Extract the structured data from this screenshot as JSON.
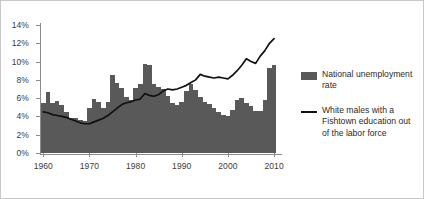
{
  "chart_data": {
    "type": "bar",
    "title": "",
    "subtitle": "",
    "xlabel": "",
    "ylabel": "",
    "xlim": [
      1959.5,
      2011.5
    ],
    "ylim": [
      0,
      14
    ],
    "ytick_labels": [
      "0%",
      "2%",
      "4%",
      "6%",
      "8%",
      "10%",
      "12%",
      "14%"
    ],
    "ytick_values": [
      0,
      2,
      4,
      6,
      8,
      10,
      12,
      14
    ],
    "xtick_labels": [
      "1960",
      "1970",
      "1980",
      "1990",
      "2000",
      "2010"
    ],
    "xtick_values": [
      1960,
      1970,
      1980,
      1990,
      2000,
      2010
    ],
    "grid": false,
    "legend_position": "right",
    "x": [
      1960,
      1961,
      1962,
      1963,
      1964,
      1965,
      1966,
      1967,
      1968,
      1969,
      1970,
      1971,
      1972,
      1973,
      1974,
      1975,
      1976,
      1977,
      1978,
      1979,
      1980,
      1981,
      1982,
      1983,
      1984,
      1985,
      1986,
      1987,
      1988,
      1989,
      1990,
      1991,
      1992,
      1993,
      1994,
      1995,
      1996,
      1997,
      1998,
      1999,
      2000,
      2001,
      2002,
      2003,
      2004,
      2005,
      2006,
      2007,
      2008,
      2009,
      2010
    ],
    "series": [
      {
        "name": "National unemployment rate",
        "type": "bar",
        "color": "#595959",
        "values": [
          5.5,
          6.7,
          5.5,
          5.7,
          5.2,
          4.5,
          3.8,
          3.8,
          3.6,
          3.5,
          4.9,
          5.9,
          5.6,
          4.9,
          5.6,
          8.5,
          7.7,
          7.1,
          6.1,
          5.8,
          7.1,
          7.6,
          9.7,
          9.6,
          7.5,
          7.2,
          7.0,
          6.2,
          5.5,
          5.3,
          5.6,
          6.8,
          7.5,
          6.9,
          6.1,
          5.6,
          5.4,
          4.9,
          4.5,
          4.2,
          4.0,
          4.7,
          5.8,
          6.0,
          5.5,
          5.1,
          4.6,
          4.6,
          5.8,
          9.3,
          9.6
        ]
      },
      {
        "name": "White males with a Fishtown education out of the labor force",
        "type": "line",
        "color": "#111111",
        "values": [
          4.5,
          4.4,
          4.2,
          4.1,
          4.0,
          3.9,
          3.7,
          3.5,
          3.3,
          3.2,
          3.2,
          3.4,
          3.6,
          3.8,
          4.1,
          4.5,
          4.9,
          5.3,
          5.5,
          5.6,
          5.8,
          5.9,
          6.5,
          6.3,
          6.2,
          6.4,
          6.8,
          7.0,
          6.9,
          7.0,
          7.2,
          7.4,
          7.7,
          8.0,
          8.6,
          8.4,
          8.3,
          8.2,
          8.3,
          8.2,
          8.1,
          8.5,
          9.0,
          9.6,
          10.3,
          10.0,
          9.8,
          10.6,
          11.2,
          12.0,
          12.5
        ]
      }
    ]
  },
  "legend": {
    "items": [
      {
        "marker": "bar-swatch",
        "label": "National unemployment rate"
      },
      {
        "marker": "line-swatch",
        "label": "White males with a Fishtown education out of the labor force"
      }
    ]
  },
  "colors": {
    "bar": "#595959",
    "line": "#111111",
    "axis": "#8c8c8c",
    "border": "#c8c8c8",
    "background": "#ffffff",
    "text": "#3a3a3a"
  }
}
